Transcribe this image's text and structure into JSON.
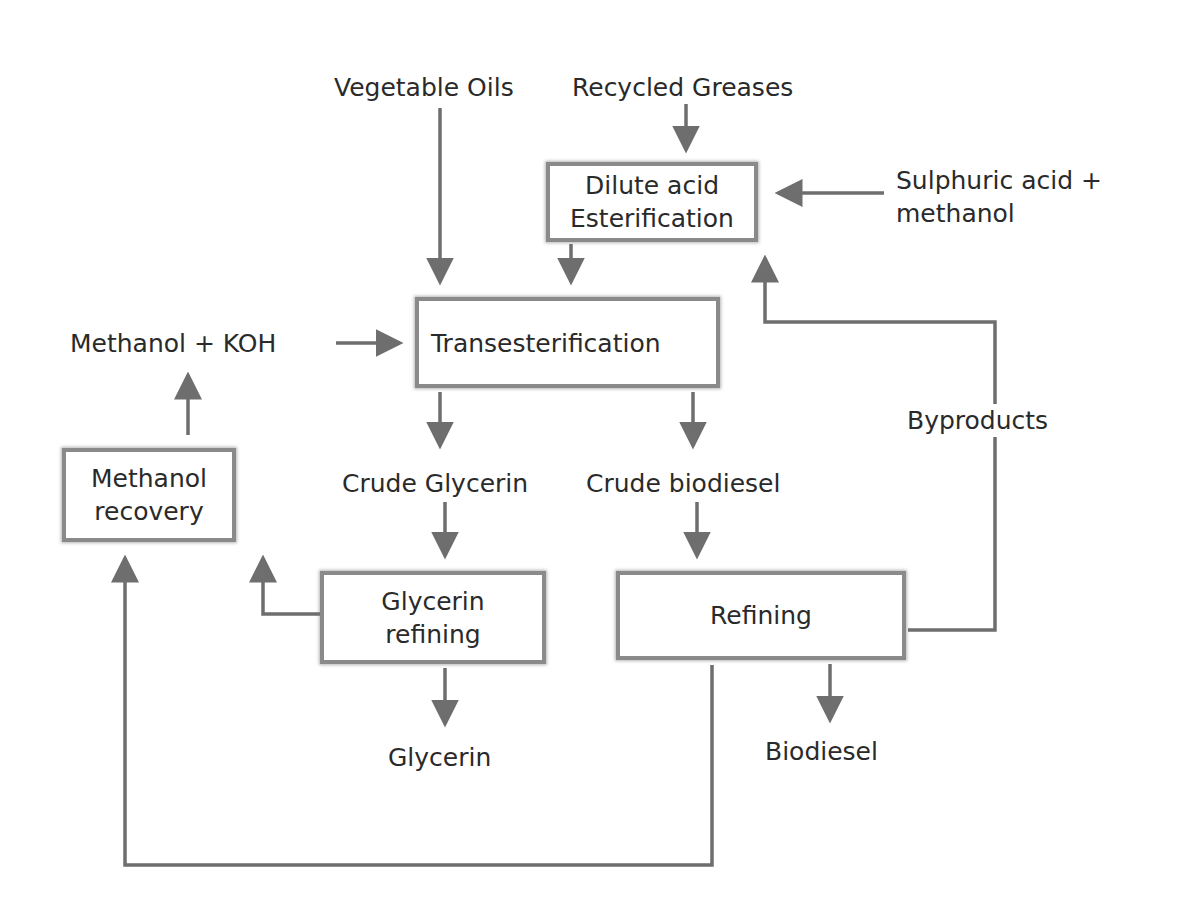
{
  "diagram": {
    "type": "process-flow",
    "colors": {
      "line": "#6e6e6e",
      "box_border": "#8a8a8a",
      "text": "#2a2a2a",
      "background": "#ffffff"
    },
    "inputs": {
      "vegetable_oils": "Vegetable Oils",
      "recycled_greases": "Recycled Greases",
      "sulphuric_line1": "Sulphuric acid +",
      "sulphuric_line2": "methanol",
      "methanol_koh": "Methanol + KOH"
    },
    "processes": {
      "esterification_line1": "Dilute acid",
      "esterification_line2": "Esterification",
      "transesterification": "Transesterification",
      "methanol_recovery_line1": "Methanol",
      "methanol_recovery_line2": "recovery",
      "glycerin_refining_line1": "Glycerin",
      "glycerin_refining_line2": "refining",
      "refining": "Refining"
    },
    "intermediates": {
      "crude_glycerin": "Crude Glycerin",
      "crude_biodiesel": "Crude biodiesel",
      "byproducts": "Byproducts"
    },
    "outputs": {
      "glycerin": "Glycerin",
      "biodiesel": "Biodiesel"
    },
    "edges": [
      [
        "Vegetable Oils",
        "Transesterification"
      ],
      [
        "Recycled Greases",
        "Dilute acid Esterification"
      ],
      [
        "Sulphuric acid + methanol",
        "Dilute acid Esterification"
      ],
      [
        "Dilute acid Esterification",
        "Transesterification"
      ],
      [
        "Methanol + KOH",
        "Transesterification"
      ],
      [
        "Transesterification",
        "Crude Glycerin"
      ],
      [
        "Transesterification",
        "Crude biodiesel"
      ],
      [
        "Crude Glycerin",
        "Glycerin refining"
      ],
      [
        "Crude biodiesel",
        "Refining"
      ],
      [
        "Glycerin refining",
        "Glycerin"
      ],
      [
        "Glycerin refining",
        "Methanol recovery"
      ],
      [
        "Refining",
        "Biodiesel"
      ],
      [
        "Refining",
        "Methanol recovery"
      ],
      [
        "Refining",
        "Byproducts"
      ],
      [
        "Byproducts",
        "Dilute acid Esterification"
      ],
      [
        "Methanol recovery",
        "Methanol + KOH"
      ]
    ]
  }
}
